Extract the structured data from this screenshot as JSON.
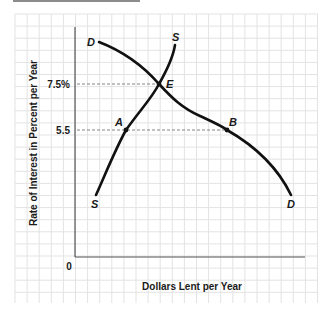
{
  "chart_data": {
    "type": "line",
    "title": "",
    "xlabel": "Dollars Lent per Year",
    "ylabel": "Rate of Interest in Percent per Year",
    "origin_label": "0",
    "y_ticks": [
      {
        "value": 7.5,
        "label": "7.5%"
      },
      {
        "value": 5.5,
        "label": "5.5"
      }
    ],
    "grid": true,
    "series": [
      {
        "name": "D",
        "role": "demand for loans",
        "end_labels": [
          "D",
          "D"
        ],
        "shape": "downward sloping"
      },
      {
        "name": "S",
        "role": "supply of loans",
        "end_labels": [
          "S",
          "S"
        ],
        "shape": "upward sloping"
      }
    ],
    "points": [
      {
        "label": "E",
        "desc": "equilibrium, intersection of S and D",
        "y": 7.5
      },
      {
        "label": "A",
        "desc": "on supply curve",
        "y": 5.5
      },
      {
        "label": "B",
        "desc": "on demand curve",
        "y": 5.5
      }
    ],
    "guides": [
      {
        "from_axis_y": 7.5,
        "to": "E",
        "style": "dashed"
      },
      {
        "from_axis_y": 5.5,
        "to": "B",
        "through": "A",
        "style": "dashed"
      }
    ]
  },
  "labels": {
    "xlabel": "Dollars Lent per Year",
    "ylabel": "Rate of Interest in Percent per Year",
    "origin": "0",
    "tick_75": "7.5%",
    "tick_55": "5.5",
    "D_top": "D",
    "D_bottom": "D",
    "S_top": "S",
    "S_bottom": "S",
    "E": "E",
    "A": "A",
    "B": "B"
  },
  "colors": {
    "grid": "#e3e3e3",
    "axis": "#555555",
    "curve": "#111111",
    "guide": "#777777"
  }
}
